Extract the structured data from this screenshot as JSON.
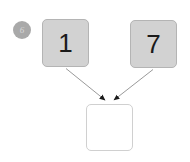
{
  "canvas": {
    "width": 190,
    "height": 162,
    "background": "#ffffff"
  },
  "step_badge": {
    "label": "6",
    "fill_color": "#a9a9a9",
    "text_color": "#d8d8d8",
    "icon": "step-number-badge"
  },
  "cards": [
    {
      "id": "card-one",
      "role": "source",
      "value": "1",
      "fill_color": "#d2d2d2",
      "border_color": "#b4b4b4",
      "text_color": "#1a1a1a"
    },
    {
      "id": "card-two",
      "role": "source",
      "value": "7",
      "fill_color": "#d2d2d2",
      "border_color": "#b4b4b4",
      "text_color": "#1a1a1a"
    },
    {
      "id": "card-result",
      "role": "target",
      "value": "",
      "fill_color": "#ffffff",
      "border_color": "#d0d0d0",
      "text_color": "#1a1a1a"
    }
  ],
  "connectors": [
    {
      "id": "arrow-from-card-one",
      "from": "card-one",
      "to": "card-result",
      "stroke_color": "#9a9a9a",
      "arrowhead": "filled-triangle"
    },
    {
      "id": "arrow-from-card-two",
      "from": "card-two",
      "to": "card-result",
      "stroke_color": "#9a9a9a",
      "arrowhead": "filled-triangle"
    }
  ]
}
